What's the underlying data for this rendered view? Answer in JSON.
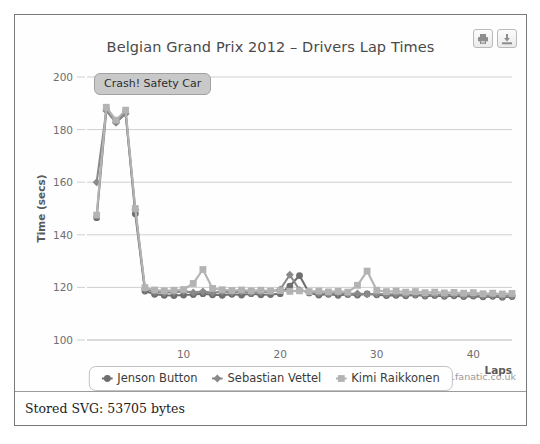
{
  "window": {
    "status_text": "Stored SVG: 53705 bytes"
  },
  "toolbar": {
    "print_icon": "printer-icon",
    "print_label": "Print",
    "download_icon": "download-icon",
    "download_label": "Download"
  },
  "source_note": "Source: www.f1fanatic.co.uk",
  "colors": {
    "jenson": "#6f6f6f",
    "vettel": "#8a8a8a",
    "kimi": "#b3b3b3",
    "grid": "#cfcfcf",
    "axis": "#b5b5b5",
    "annotation_bg": "#c9c9c9"
  },
  "chart_data": {
    "type": "line",
    "title": "Belgian Grand Prix 2012 – Drivers Lap Times",
    "xlabel": "Laps",
    "ylabel": "Time (secs)",
    "xlim": [
      0,
      44
    ],
    "ylim": [
      100,
      200
    ],
    "xticks": [
      10,
      20,
      30,
      40
    ],
    "yticks": [
      100,
      120,
      140,
      160,
      180,
      200
    ],
    "grid": true,
    "legend_position": "bottom",
    "annotations": [
      {
        "text": "Crash! Safety Car",
        "lap": 2,
        "time": 196
      }
    ],
    "x": [
      1,
      2,
      3,
      4,
      5,
      6,
      7,
      8,
      9,
      10,
      11,
      12,
      13,
      14,
      15,
      16,
      17,
      18,
      19,
      20,
      21,
      22,
      23,
      24,
      25,
      26,
      27,
      28,
      29,
      30,
      31,
      32,
      33,
      34,
      35,
      36,
      37,
      38,
      39,
      40,
      41,
      42,
      43,
      44
    ],
    "series": [
      {
        "name": "Jenson Button",
        "marker": "circle",
        "color": "#6f6f6f",
        "values": [
          146.5,
          187.6,
          183.0,
          186.5,
          148.0,
          118.6,
          117.4,
          117.0,
          116.9,
          117.1,
          117.3,
          117.6,
          117.2,
          117.0,
          117.4,
          117.1,
          117.6,
          117.2,
          117.3,
          117.6,
          120.5,
          124.5,
          117.9,
          117.1,
          117.4,
          117.0,
          117.3,
          117.1,
          117.5,
          117.2,
          116.9,
          117.0,
          116.8,
          117.1,
          116.7,
          116.9,
          116.6,
          116.8,
          116.5,
          116.7,
          116.4,
          116.6,
          116.3,
          116.5
        ]
      },
      {
        "name": "Sebastian Vettel",
        "marker": "diamond",
        "color": "#8a8a8a",
        "values": [
          160.0,
          187.2,
          182.6,
          186.0,
          149.5,
          119.4,
          118.3,
          118.0,
          118.2,
          118.5,
          118.1,
          118.4,
          118.0,
          118.3,
          118.1,
          118.4,
          118.0,
          118.2,
          118.4,
          119.2,
          124.8,
          119.0,
          118.2,
          117.8,
          117.6,
          117.9,
          117.5,
          117.7,
          117.4,
          117.6,
          117.3,
          117.5,
          117.2,
          117.4,
          117.1,
          117.3,
          117.0,
          117.2,
          116.9,
          117.1,
          116.8,
          117.0,
          116.7,
          116.9
        ]
      },
      {
        "name": "Kimi Raikkonen",
        "marker": "square",
        "color": "#b3b3b3",
        "values": [
          147.5,
          188.5,
          183.6,
          187.4,
          150.0,
          119.9,
          119.0,
          118.7,
          118.9,
          119.2,
          121.5,
          126.8,
          119.6,
          119.1,
          118.8,
          119.0,
          118.7,
          118.9,
          118.6,
          118.8,
          118.5,
          118.7,
          118.4,
          118.6,
          118.3,
          118.5,
          118.2,
          120.8,
          126.2,
          118.9,
          118.4,
          118.6,
          118.2,
          118.4,
          118.0,
          118.2,
          117.9,
          118.1,
          117.8,
          118.0,
          117.6,
          117.8,
          117.5,
          117.7
        ]
      }
    ]
  }
}
